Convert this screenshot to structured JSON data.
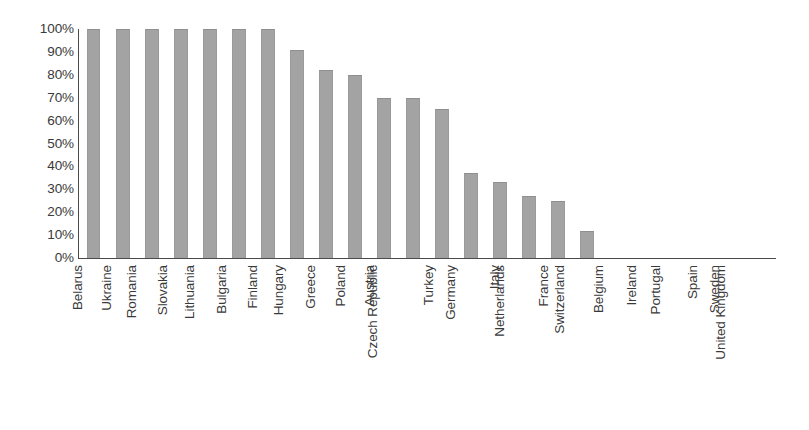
{
  "chart_data": {
    "type": "bar",
    "title": "",
    "subtitle": "",
    "xlabel": "",
    "ylabel": "",
    "ylim": [
      0,
      100
    ],
    "ytick_labels": [
      "100%",
      "90%",
      "80%",
      "70%",
      "60%",
      "50%",
      "40%",
      "30%",
      "20%",
      "10%",
      "0%"
    ],
    "ytick_values": [
      100,
      90,
      80,
      70,
      60,
      50,
      40,
      30,
      20,
      10,
      0
    ],
    "grid": false,
    "legend": false,
    "legend_position": "none",
    "bar_color": "#a3a3a3",
    "axis_color": "#4a4a4a",
    "text_color": "#3a3a3a",
    "categories": [
      "Belarus",
      "Ukraine",
      "Romania",
      "Slovakia",
      "Lithuania",
      "Bulgaria",
      "Finland",
      "Hungary",
      "Greece",
      "Poland",
      "Austria",
      "Czech Republic",
      "Turkey",
      "Germany",
      "Italy",
      "Netherlands",
      "France",
      "Switzerland",
      "Belgium",
      "Ireland",
      "Portugal",
      "Spain",
      "Sweden",
      "United Kingdom"
    ],
    "values": [
      100,
      100,
      100,
      100,
      100,
      100,
      100,
      91,
      82,
      80,
      70,
      70,
      65,
      37,
      33,
      27,
      25,
      12,
      0,
      0,
      0,
      0,
      0,
      0
    ],
    "value_labels": [
      "100%",
      "100%",
      "100%",
      "100%",
      "100%",
      "100%",
      "100%",
      "91%",
      "82%",
      "80%",
      "70%",
      "70%",
      "65%",
      "37%",
      "33%",
      "27%",
      "25%",
      "12%",
      "0%",
      "0%",
      "0%",
      "0%",
      "0%",
      "0%"
    ]
  }
}
